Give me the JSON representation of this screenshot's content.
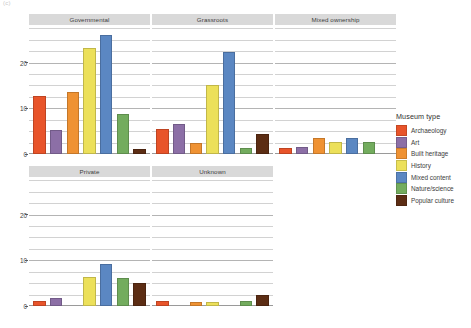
{
  "corner_mark": "(c)",
  "legend": {
    "title": "Museum type",
    "items": [
      {
        "label": "Archaeology",
        "color": "#e8542a"
      },
      {
        "label": "Art",
        "color": "#8c6fa6"
      },
      {
        "label": "Built heritage",
        "color": "#ef9233"
      },
      {
        "label": "History",
        "color": "#ece05a"
      },
      {
        "label": "Mixed content",
        "color": "#5b87c2"
      },
      {
        "label": "Nature/science",
        "color": "#73ac5e"
      },
      {
        "label": "Popular culture",
        "color": "#5c2d14"
      }
    ]
  },
  "axis": {
    "ticks": [
      "0",
      "10",
      "20"
    ],
    "tick_values": [
      0,
      10,
      20
    ],
    "ylim": [
      0,
      28
    ]
  },
  "chart_data": {
    "type": "bar",
    "title": "",
    "xlabel": "",
    "ylabel": "",
    "ylim": [
      0,
      28
    ],
    "grid": true,
    "legend_position": "right",
    "legend_title": "Museum type",
    "facet_by": "governance",
    "categories": [
      "Archaeology",
      "Art",
      "Built heritage",
      "History",
      "Mixed content",
      "Nature/science",
      "Popular culture"
    ],
    "colors": [
      "#e8542a",
      "#8c6fa6",
      "#ef9233",
      "#ece05a",
      "#5b87c2",
      "#73ac5e",
      "#5c2d14"
    ],
    "panels": [
      {
        "name": "Governmental",
        "values": [
          12.8,
          5.2,
          13.6,
          23.3,
          26.0,
          8.7,
          1.1
        ]
      },
      {
        "name": "Grassroots",
        "values": [
          5.4,
          6.6,
          2.5,
          15.2,
          22.3,
          1.4,
          4.3
        ]
      },
      {
        "name": "Mixed ownership",
        "values": [
          1.4,
          1.5,
          3.6,
          2.7,
          3.4,
          2.6,
          0.0
        ]
      },
      {
        "name": "Private",
        "values": [
          1.2,
          1.8,
          0.0,
          6.4,
          9.3,
          6.2,
          5.1
        ]
      },
      {
        "name": "Unknown",
        "values": [
          1.1,
          0.0,
          0.9,
          0.9,
          0.0,
          1.0,
          2.4
        ]
      }
    ]
  }
}
